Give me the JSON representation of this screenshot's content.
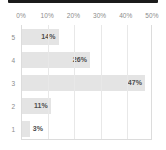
{
  "chart_data": {
    "type": "bar",
    "orientation": "horizontal",
    "title": "",
    "subtitle": "",
    "xlabel": "",
    "ylabel": "",
    "categories": [
      "5",
      "4",
      "3",
      "2",
      "1"
    ],
    "values": [
      14,
      26,
      47,
      11,
      3
    ],
    "data_labels": [
      "14%",
      "26%",
      "47%",
      "11%",
      "3%"
    ],
    "xlim": [
      0,
      50
    ],
    "ylim": null,
    "xticks": [
      0,
      10,
      20,
      30,
      40,
      50
    ],
    "xtick_labels": [
      "0%",
      "10%",
      "20%",
      "30%",
      "40%",
      "50%"
    ],
    "ytick_labels": [
      "5",
      "4",
      "3",
      "2",
      "1"
    ],
    "xaxis_position": "top",
    "grid": "vertical",
    "legend": null,
    "series": [
      {
        "name": "",
        "values": [
          14,
          26,
          47,
          11,
          3
        ]
      }
    ],
    "colors": {
      "bar_fill": "#e4e4e4",
      "data_label": "#4d4d4d",
      "tick_label": "#8c8c8c",
      "gridline": "#e8e8e8",
      "plot_background": "#ffffff",
      "top_strip": "#1b1b1b"
    }
  },
  "chrome": {
    "top_strip_name": "window-top-edge"
  }
}
